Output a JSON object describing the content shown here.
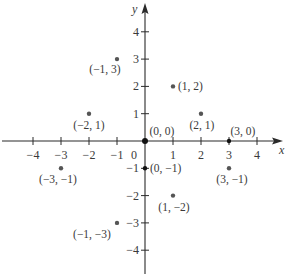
{
  "chart_data": {
    "type": "scatter",
    "title": "",
    "xlabel": "x",
    "ylabel": "y",
    "xlim": [
      -4.5,
      4.8
    ],
    "ylim": [
      -4.8,
      4.5
    ],
    "grid": false,
    "legend": null,
    "x_ticks": [
      -4,
      -3,
      -2,
      -1,
      0,
      1,
      2,
      3,
      4
    ],
    "y_ticks": [
      -4,
      -3,
      -2,
      -1,
      1,
      2,
      3,
      4
    ],
    "x_tick_labels": [
      "−4",
      "−3",
      "−2",
      "−1",
      "0",
      "1",
      "2",
      "3",
      "4"
    ],
    "y_tick_labels": [
      "−4",
      "−3",
      "−2",
      "−1",
      "1",
      "2",
      "3",
      "4"
    ],
    "points": [
      {
        "x": -1,
        "y": 3,
        "label": "(−1, 3)"
      },
      {
        "x": 1,
        "y": 2,
        "label": "(1, 2)"
      },
      {
        "x": -2,
        "y": 1,
        "label": "(−2, 1)"
      },
      {
        "x": 2,
        "y": 1,
        "label": "(2, 1)"
      },
      {
        "x": 0,
        "y": 0,
        "label": "(0, 0)"
      },
      {
        "x": 3,
        "y": 0,
        "label": "(3, 0)"
      },
      {
        "x": -3,
        "y": -1,
        "label": "(−3, −1)"
      },
      {
        "x": 0,
        "y": -1,
        "label": "(0, −1)"
      },
      {
        "x": 3,
        "y": -1,
        "label": "(3, −1)"
      },
      {
        "x": 1,
        "y": -2,
        "label": "(1, −2)"
      },
      {
        "x": -1,
        "y": -3,
        "label": "(−1, −3)"
      }
    ],
    "colors": {
      "axis": "#2a2a2a",
      "point": "#555555",
      "origin_point": "#111111",
      "label": "#555555"
    }
  }
}
